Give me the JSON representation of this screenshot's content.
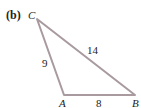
{
  "figure": {
    "part_label": "(b)",
    "vertices": {
      "A": {
        "label": "A",
        "x": 64,
        "y": 95
      },
      "B": {
        "label": "B",
        "x": 135,
        "y": 95
      },
      "C": {
        "label": "C",
        "x": 37,
        "y": 19
      }
    },
    "sides": {
      "AC": "9",
      "CB": "14",
      "AB": "8"
    },
    "line_color": "#a89a9f"
  }
}
